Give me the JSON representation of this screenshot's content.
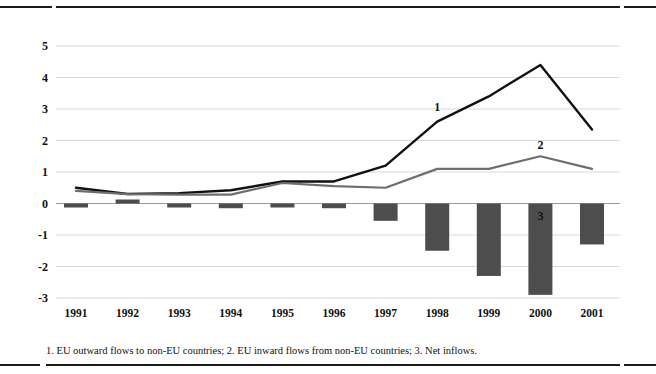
{
  "footnote": "1. EU outward flows to non-EU countries; 2. EU inward flows from non-EU countries; 3. Net inflows.",
  "colors": {
    "series1": "#111111",
    "series2": "#6e6e6e",
    "bars": "#4d4d4d",
    "grid": "#d9d9d9",
    "rule": "#1a1a1a",
    "text": "#111111"
  },
  "series_labels": [
    {
      "text": "1",
      "year": "1998",
      "value": 3.05
    },
    {
      "text": "2",
      "year": "2000",
      "value": 1.85
    },
    {
      "text": "3",
      "year": "2000",
      "value": -0.4
    }
  ],
  "chart_data": {
    "type": "line",
    "title": "",
    "subtitle": "",
    "xlabel": "",
    "ylabel": "",
    "categories": [
      "1991",
      "1992",
      "1993",
      "1994",
      "1995",
      "1996",
      "1997",
      "1998",
      "1999",
      "2000",
      "2001"
    ],
    "ylim": [
      -3,
      5
    ],
    "yticks": [
      5,
      4,
      3,
      2,
      1,
      0,
      -1,
      -2,
      -3
    ],
    "ytick_labels": [
      "5",
      "4",
      "3",
      "2",
      "1",
      "0",
      "-1",
      "-2",
      "-3"
    ],
    "grid": true,
    "legend": "inline-annotations",
    "legend_position": "none",
    "series": [
      {
        "name": "1",
        "render": "line",
        "description": "EU outward flows to non-EU countries",
        "color": "#111111",
        "width": 2.4,
        "values": [
          0.5,
          0.3,
          0.33,
          0.42,
          0.7,
          0.7,
          1.2,
          2.6,
          3.4,
          4.4,
          2.35
        ]
      },
      {
        "name": "2",
        "render": "line",
        "description": "EU inward flows from non-EU countries",
        "color": "#6e6e6e",
        "width": 2.2,
        "values": [
          0.4,
          0.3,
          0.28,
          0.28,
          0.65,
          0.55,
          0.5,
          1.1,
          1.1,
          1.5,
          1.1
        ]
      },
      {
        "name": "3",
        "render": "bar",
        "description": "Net inflows",
        "color": "#4d4d4d",
        "values": [
          -0.1,
          0.07,
          -0.1,
          -0.15,
          -0.08,
          -0.15,
          -0.55,
          -1.5,
          -2.3,
          -2.9,
          -1.3
        ]
      }
    ]
  }
}
